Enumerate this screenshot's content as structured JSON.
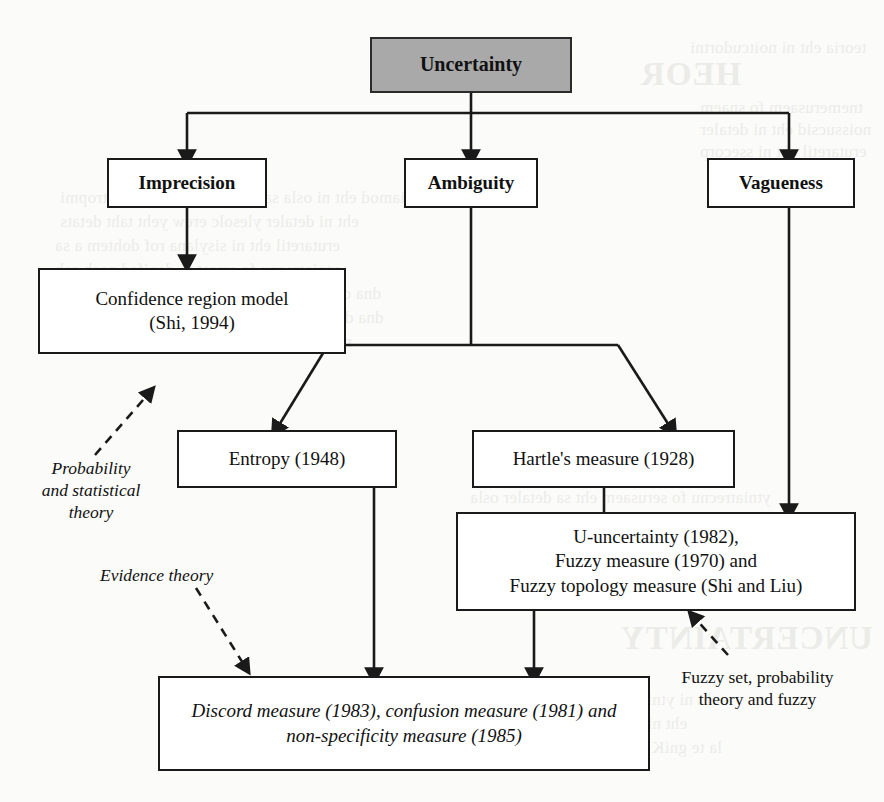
{
  "figure": {
    "type": "flowchart",
    "title_node": "Uncertainty",
    "orientation": "top-down",
    "background_color": "#fbfbf9",
    "node_fill_root": "#a9a9a9",
    "node_fill_default": "#ffffff",
    "stroke_color": "#1a1a1a"
  },
  "nodes": {
    "root": {
      "label": "Uncertainty"
    },
    "imprecision": {
      "label": "Imprecision"
    },
    "ambiguity": {
      "label": "Ambiguity"
    },
    "vagueness": {
      "label": "Vagueness"
    },
    "confidence_region": {
      "line1": "Confidence region model",
      "line2": "(Shi, 1994)"
    },
    "entropy": {
      "label": "Entropy (1948)"
    },
    "hartle": {
      "label": "Hartle's measure (1928)"
    },
    "u_uncertainty": {
      "line1": "U-uncertainty (1982),",
      "line2": "Fuzzy measure (1970) and",
      "line3": "Fuzzy topology measure (Shi and Liu)"
    },
    "discord": {
      "line1": "Discord measure (1983), confusion measure (1981) and",
      "line2": "non-specificity measure (1985)"
    }
  },
  "annotations": {
    "probability_statistical": "Probability\nand statistical\ntheory",
    "evidence_theory": "Evidence theory",
    "fuzzy_set": "Fuzzy set, probability\ntheory and fuzzy"
  },
  "edges": [
    {
      "from": "root",
      "to": "imprecision",
      "style": "solid-arrow"
    },
    {
      "from": "root",
      "to": "ambiguity",
      "style": "solid-arrow"
    },
    {
      "from": "root",
      "to": "vagueness",
      "style": "solid-arrow"
    },
    {
      "from": "imprecision",
      "to": "confidence_region",
      "style": "solid-arrow"
    },
    {
      "from": "ambiguity",
      "to": "entropy",
      "style": "solid-arrow"
    },
    {
      "from": "ambiguity",
      "to": "hartle",
      "style": "solid-arrow"
    },
    {
      "from": "vagueness",
      "to": "u_uncertainty",
      "style": "solid-arrow"
    },
    {
      "from": "hartle",
      "to": "u_uncertainty",
      "style": "solid-line"
    },
    {
      "from": "entropy",
      "to": "discord",
      "style": "solid-arrow"
    },
    {
      "from": "u_uncertainty",
      "to": "discord",
      "style": "solid-arrow"
    },
    {
      "from": "probability_statistical",
      "to": "confidence_region",
      "style": "dashed-arrow"
    },
    {
      "from": "evidence_theory",
      "to": "discord",
      "style": "dashed-arrow"
    },
    {
      "from": "fuzzy_set",
      "to": "u_uncertainty",
      "style": "dashed-arrow"
    }
  ],
  "page_bleed": {
    "lines": [
      "HEOR",
      "UNCERTAINTY"
    ]
  }
}
